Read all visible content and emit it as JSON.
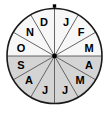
{
  "figure": {
    "name": "month-spinner-wheel",
    "title": "",
    "shape": "circle",
    "sector_count": 12,
    "colors": {
      "outline": "#1a1a1a",
      "spoke": "#555555",
      "unshaded_fill": "#f7f7f7",
      "shaded_fill": "#d4d4d4",
      "label_text": "#000000",
      "hub": "#000000",
      "top_marker": "#000000",
      "background": "#ffffff"
    },
    "geometry": {
      "center_x": 54.5,
      "center_y": 56,
      "radius": 47.5,
      "top_marker_x": 54.5,
      "top_marker_y": 6,
      "hub_radius": 2.4,
      "sector_degrees": 30,
      "start_angle_degrees": 0
    }
  },
  "chart_data": {
    "type": "pie",
    "title": "",
    "subtitle": "",
    "xlabel": "",
    "ylabel": "",
    "legend": [],
    "grid": false,
    "equal_sectors": true,
    "sector_degrees": 30,
    "order": "clockwise-from-top",
    "categories": [
      "J",
      "F",
      "M",
      "A",
      "M",
      "J",
      "J",
      "A",
      "S",
      "O",
      "N",
      "D"
    ],
    "values": [
      30,
      30,
      30,
      30,
      30,
      30,
      30,
      30,
      30,
      30,
      30,
      30
    ],
    "sectors": [
      {
        "label": "J",
        "full_name": "January",
        "index": 0,
        "start_deg": 0,
        "end_deg": 30,
        "shaded": false,
        "label_x": 66,
        "label_y": 22
      },
      {
        "label": "F",
        "full_name": "February",
        "index": 1,
        "start_deg": 30,
        "end_deg": 60,
        "shaded": false,
        "label_x": 81,
        "label_y": 32
      },
      {
        "label": "M",
        "full_name": "March",
        "index": 2,
        "start_deg": 60,
        "end_deg": 90,
        "shaded": false,
        "label_x": 89,
        "label_y": 48
      },
      {
        "label": "A",
        "full_name": "April",
        "index": 3,
        "start_deg": 90,
        "end_deg": 120,
        "shaded": true,
        "label_x": 89,
        "label_y": 65
      },
      {
        "label": "M",
        "full_name": "May",
        "index": 4,
        "start_deg": 120,
        "end_deg": 150,
        "shaded": true,
        "label_x": 80,
        "label_y": 80
      },
      {
        "label": "J",
        "full_name": "June",
        "index": 5,
        "start_deg": 150,
        "end_deg": 180,
        "shaded": true,
        "label_x": 65,
        "label_y": 90
      },
      {
        "label": "J",
        "full_name": "July",
        "index": 6,
        "start_deg": 180,
        "end_deg": 210,
        "shaded": true,
        "label_x": 45,
        "label_y": 90
      },
      {
        "label": "A",
        "full_name": "August",
        "index": 7,
        "start_deg": 210,
        "end_deg": 240,
        "shaded": true,
        "label_x": 29,
        "label_y": 80
      },
      {
        "label": "S",
        "full_name": "September",
        "index": 8,
        "start_deg": 240,
        "end_deg": 270,
        "shaded": true,
        "label_x": 21,
        "label_y": 65
      },
      {
        "label": "O",
        "full_name": "October",
        "index": 9,
        "start_deg": 270,
        "end_deg": 300,
        "shaded": false,
        "label_x": 21,
        "label_y": 48
      },
      {
        "label": "N",
        "full_name": "November",
        "index": 10,
        "start_deg": 300,
        "end_deg": 330,
        "shaded": false,
        "label_x": 30,
        "label_y": 32
      },
      {
        "label": "D",
        "full_name": "December",
        "index": 11,
        "start_deg": 330,
        "end_deg": 360,
        "shaded": false,
        "label_x": 44,
        "label_y": 22
      }
    ],
    "shaded_sector_labels": [
      "A",
      "M",
      "J",
      "J",
      "A",
      "S"
    ],
    "shaded_count": 6,
    "unshaded_count": 6
  }
}
